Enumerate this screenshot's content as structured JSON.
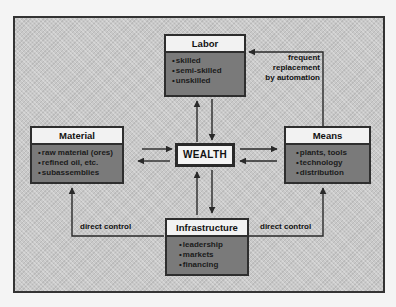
{
  "diagram": {
    "center": {
      "label": "WEALTH"
    },
    "nodes": {
      "labor": {
        "title": "Labor",
        "items": [
          "skilled",
          "semi-skilled",
          "unskilled"
        ]
      },
      "material": {
        "title": "Material",
        "items": [
          "raw material (ores)",
          "refined oil, etc.",
          "subassemblies"
        ]
      },
      "means": {
        "title": "Means",
        "items": [
          "plants, tools",
          "technology",
          "distribution"
        ]
      },
      "infrastructure": {
        "title": "Infrastructure",
        "items": [
          "leadership",
          "markets",
          "financing"
        ]
      }
    },
    "edge_labels": {
      "means_to_labor": [
        "frequent",
        "replacement",
        "by automation"
      ],
      "infra_to_material": "direct control",
      "infra_to_means": "direct control"
    },
    "edges": [
      {
        "from": "Labor",
        "to": "WEALTH"
      },
      {
        "from": "WEALTH",
        "to": "Labor"
      },
      {
        "from": "Material",
        "to": "WEALTH"
      },
      {
        "from": "WEALTH",
        "to": "Material"
      },
      {
        "from": "Means",
        "to": "WEALTH"
      },
      {
        "from": "WEALTH",
        "to": "Means"
      },
      {
        "from": "Infrastructure",
        "to": "WEALTH"
      },
      {
        "from": "WEALTH",
        "to": "Infrastructure"
      },
      {
        "from": "Means",
        "to": "Labor",
        "label": "frequent replacement by automation"
      },
      {
        "from": "Infrastructure",
        "to": "Material",
        "label": "direct control"
      },
      {
        "from": "Infrastructure",
        "to": "Means",
        "label": "direct control"
      }
    ],
    "colors": {
      "background": "#c9c9c9",
      "box_body": "#7a7a7a",
      "box_header": "#f2f2f2",
      "stroke": "#2e2e2e"
    }
  }
}
